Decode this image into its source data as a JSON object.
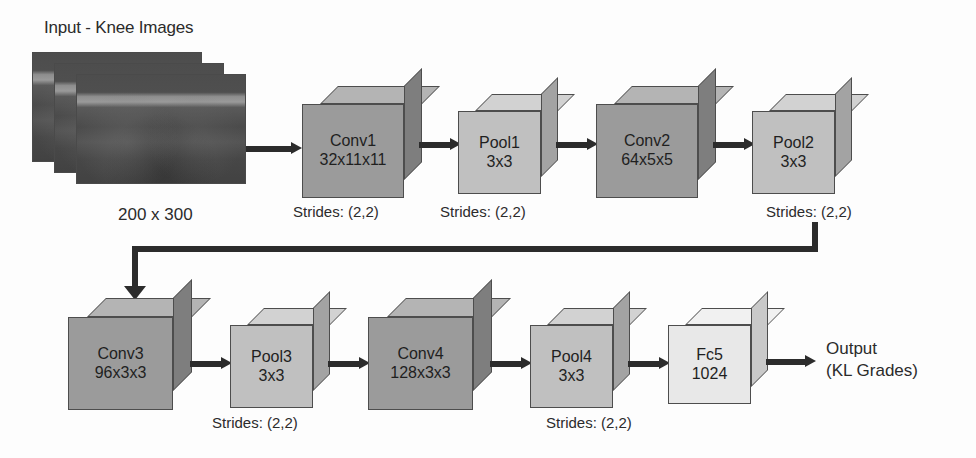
{
  "diagram": {
    "title_input": "Input - Knee Images",
    "input_dims": "200 x 300",
    "input_image_count": 3,
    "output_label_line1": "Output",
    "output_label_line2": "(KL Grades)",
    "strides_text": "Strides: (2,2)",
    "colors": {
      "conv_front": "#9b9b9b",
      "conv_top": "#b4b4b4",
      "conv_side": "#7e7e7e",
      "pool_front": "#c0c0c0",
      "pool_top": "#d2d2d2",
      "pool_side": "#a3a3a3",
      "fc_front": "#e8e8e8",
      "fc_top": "#f1f1f1",
      "fc_side": "#c9c9c9",
      "arrow": "#2c2c2c",
      "outline": "#4d4d4d",
      "text": "#1f1f1f",
      "background": "#fdfdfd"
    },
    "layers": [
      {
        "id": "conv1",
        "name": "Conv1",
        "dim": "32x11x11",
        "kind": "conv",
        "row": 1,
        "strides": "Strides: (2,2)"
      },
      {
        "id": "pool1",
        "name": "Pool1",
        "dim": "3x3",
        "kind": "pool",
        "row": 1,
        "strides": "Strides: (2,2)"
      },
      {
        "id": "conv2",
        "name": "Conv2",
        "dim": "64x5x5",
        "kind": "conv",
        "row": 1,
        "strides": ""
      },
      {
        "id": "pool2",
        "name": "Pool2",
        "dim": "3x3",
        "kind": "pool",
        "row": 1,
        "strides": "Strides: (2,2)"
      },
      {
        "id": "conv3",
        "name": "Conv3",
        "dim": "96x3x3",
        "kind": "conv",
        "row": 2,
        "strides": ""
      },
      {
        "id": "pool3",
        "name": "Pool3",
        "dim": "3x3",
        "kind": "pool",
        "row": 2,
        "strides": "Strides: (2,2)"
      },
      {
        "id": "conv4",
        "name": "Conv4",
        "dim": "128x3x3",
        "kind": "conv",
        "row": 2,
        "strides": ""
      },
      {
        "id": "pool4",
        "name": "Pool4",
        "dim": "3x3",
        "kind": "pool",
        "row": 2,
        "strides": "Strides: (2,2)"
      },
      {
        "id": "fc5",
        "name": "Fc5",
        "dim": "1024",
        "kind": "fc",
        "row": 2,
        "strides": ""
      }
    ]
  }
}
